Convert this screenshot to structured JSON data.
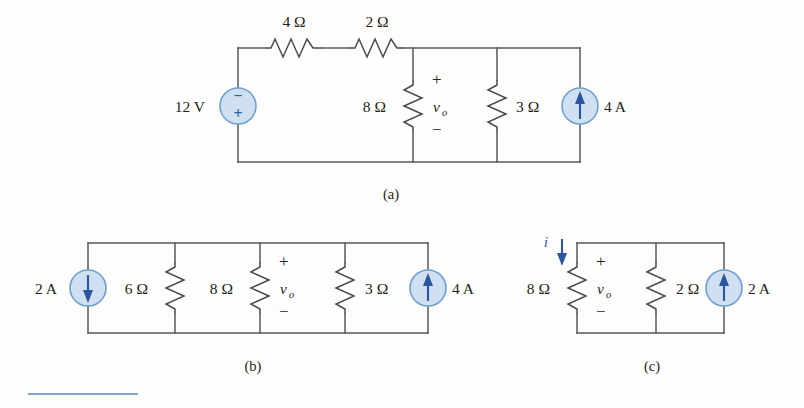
{
  "figure": {
    "name": "three-equivalent-circuits",
    "captions": [
      {
        "id": "caption-a",
        "text": "(a)"
      },
      {
        "id": "caption-b",
        "text": "(b)"
      },
      {
        "id": "caption-c",
        "text": "(c)"
      }
    ]
  },
  "circuit_a": {
    "label": "(a)",
    "voltage_source": {
      "value": "12 V",
      "polarity_top": "−",
      "polarity_bottom": "+",
      "type": "voltage-source"
    },
    "resistors": [
      {
        "name": "r-4ohm",
        "value": "4 Ω",
        "orientation": "horizontal"
      },
      {
        "name": "r-2ohm",
        "value": "2 Ω",
        "orientation": "horizontal"
      },
      {
        "name": "r-8ohm",
        "value": "8 Ω",
        "orientation": "vertical"
      },
      {
        "name": "r-3ohm",
        "value": "3 Ω",
        "orientation": "vertical"
      }
    ],
    "voltage_label": {
      "symbol": "v",
      "subscript": "o",
      "plus": "+",
      "minus": "−"
    },
    "current_source": {
      "value": "4 A",
      "direction": "up",
      "type": "current-source"
    }
  },
  "circuit_b": {
    "label": "(b)",
    "current_source_left": {
      "value": "2 A",
      "direction": "down",
      "type": "current-source"
    },
    "resistors": [
      {
        "name": "r-6ohm",
        "value": "6 Ω",
        "orientation": "vertical"
      },
      {
        "name": "r-8ohm",
        "value": "8 Ω",
        "orientation": "vertical"
      },
      {
        "name": "r-3ohm",
        "value": "3 Ω",
        "orientation": "vertical"
      }
    ],
    "voltage_label": {
      "symbol": "v",
      "subscript": "o",
      "plus": "+",
      "minus": "−"
    },
    "current_source_right": {
      "value": "4 A",
      "direction": "up",
      "type": "current-source"
    }
  },
  "circuit_c": {
    "label": "(c)",
    "current_arrow": {
      "symbol": "i",
      "direction": "down",
      "color": "#2e64ad"
    },
    "resistors": [
      {
        "name": "r-8ohm",
        "value": "8 Ω",
        "orientation": "vertical"
      },
      {
        "name": "r-2ohm",
        "value": "2 Ω",
        "orientation": "vertical"
      }
    ],
    "voltage_label": {
      "symbol": "v",
      "subscript": "o",
      "plus": "+",
      "minus": "−"
    },
    "current_source": {
      "value": "2 A",
      "direction": "up",
      "type": "current-source"
    }
  },
  "colors": {
    "wire": "#585858",
    "source_fill": "#cfe0f2",
    "source_stroke": "#6f9fd0",
    "arrow": "#2a55a0",
    "rule": "#7fa7ce",
    "text": "#231f20"
  }
}
